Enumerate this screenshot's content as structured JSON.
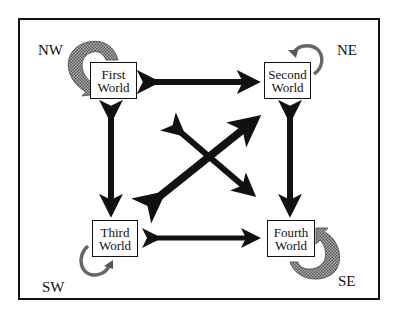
{
  "diagram": {
    "nodes": [
      {
        "id": "first",
        "line1": "First",
        "line2": "World"
      },
      {
        "id": "second",
        "line1": "Second",
        "line2": "World"
      },
      {
        "id": "third",
        "line1": "Third",
        "line2": "World"
      },
      {
        "id": "fourth",
        "line1": "Fourth",
        "line2": "World"
      }
    ],
    "corner_labels": {
      "nw": "NW",
      "ne": "NE",
      "sw": "SW",
      "se": "SE"
    },
    "edges": [
      {
        "from": "first",
        "to": "second",
        "type": "bidirectional"
      },
      {
        "from": "first",
        "to": "third",
        "type": "bidirectional"
      },
      {
        "from": "second",
        "to": "fourth",
        "type": "bidirectional"
      },
      {
        "from": "third",
        "to": "fourth",
        "type": "bidirectional"
      },
      {
        "from": "third",
        "to": "second",
        "type": "bidirectional",
        "weight": "heavy"
      },
      {
        "from": "first",
        "to": "fourth",
        "type": "bidirectional"
      }
    ],
    "self_loops": [
      {
        "node": "first",
        "corner": "nw",
        "size": "large",
        "fill": "shaded"
      },
      {
        "node": "second",
        "corner": "ne",
        "size": "small",
        "fill": "shaded"
      },
      {
        "node": "third",
        "corner": "sw",
        "size": "small",
        "fill": "shaded"
      },
      {
        "node": "fourth",
        "corner": "se",
        "size": "large",
        "fill": "shaded"
      }
    ],
    "colors": {
      "ink": "#111111",
      "shade": "#8a8a8a",
      "background": "#ffffff"
    }
  }
}
